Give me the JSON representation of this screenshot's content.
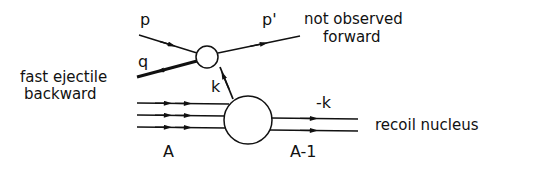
{
  "diagram": {
    "type": "feynman-like reaction diagram",
    "colors": {
      "ink": "#111111",
      "background": "#ffffff"
    },
    "particles": {
      "incoming_proton": {
        "label": "p"
      },
      "outgoing_proton": {
        "label": "p'"
      },
      "ejectile": {
        "label": "q"
      },
      "exchanged": {
        "label": "k"
      },
      "recoil_momentum": {
        "label": "-k"
      },
      "target": {
        "label": "A"
      },
      "residual": {
        "label": "A-1"
      }
    },
    "annotations": {
      "outgoing_note_line1": "not observed",
      "outgoing_note_line2": "forward",
      "ejectile_note_line1": "fast ejectile",
      "ejectile_note_line2": "backward",
      "recoil_note": "recoil nucleus"
    },
    "vertices": [
      {
        "name": "small-vertex",
        "cx": 207,
        "cy": 57,
        "r": 11
      },
      {
        "name": "nucleus-vertex",
        "cx": 248,
        "cy": 120,
        "r": 24
      }
    ]
  }
}
